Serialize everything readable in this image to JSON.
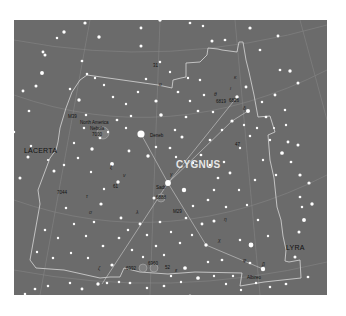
{
  "map": {
    "title": "CYGNUS",
    "background_color": "#6b6b6b",
    "boundary_color": "#d8d8d8",
    "asterism_color": "#cfcfcf",
    "neighbors": [
      {
        "name": "LACERTA",
        "x": 10,
        "y": 127
      },
      {
        "name": "LYRA",
        "x": 272,
        "y": 224
      }
    ],
    "labels": [
      {
        "text": "North America",
        "x": 80,
        "y": 121,
        "kind": "small"
      },
      {
        "text": "Nebula",
        "x": 90,
        "y": 127,
        "kind": "small"
      },
      {
        "text": "7000",
        "x": 92,
        "y": 133,
        "kind": "small"
      },
      {
        "text": "Deneb",
        "x": 150,
        "y": 134,
        "kind": "small"
      },
      {
        "text": "Sadr",
        "x": 156,
        "y": 186,
        "kind": "small"
      },
      {
        "text": "6888",
        "x": 156,
        "y": 196,
        "kind": "small"
      },
      {
        "text": "Albireo",
        "x": 247,
        "y": 276,
        "kind": "small"
      },
      {
        "text": "6826",
        "x": 229,
        "y": 99,
        "kind": "small"
      },
      {
        "text": "6819",
        "x": 216,
        "y": 100,
        "kind": "small"
      },
      {
        "text": "M39",
        "x": 68,
        "y": 115,
        "kind": "small"
      },
      {
        "text": "7044",
        "x": 57,
        "y": 191,
        "kind": "small"
      },
      {
        "text": "6992",
        "x": 126,
        "y": 267,
        "kind": "small"
      },
      {
        "text": "6960",
        "x": 148,
        "y": 262,
        "kind": "small"
      },
      {
        "text": "M29",
        "x": 173,
        "y": 210,
        "kind": "small"
      },
      {
        "text": "61",
        "x": 113,
        "y": 185,
        "kind": "small"
      },
      {
        "text": "52",
        "x": 165,
        "y": 266,
        "kind": "small"
      },
      {
        "text": "47",
        "x": 235,
        "y": 143,
        "kind": "small"
      },
      {
        "text": "31",
        "x": 153,
        "y": 64,
        "kind": "small"
      },
      {
        "text": "o",
        "x": 159,
        "y": 82,
        "kind": "greek"
      },
      {
        "text": "ε",
        "x": 175,
        "y": 268,
        "kind": "greek"
      },
      {
        "text": "ζ",
        "x": 98,
        "y": 266,
        "kind": "greek"
      },
      {
        "text": "ν",
        "x": 123,
        "y": 173,
        "kind": "greek"
      },
      {
        "text": "ξ",
        "x": 110,
        "y": 165,
        "kind": "greek"
      },
      {
        "text": "τ",
        "x": 86,
        "y": 194,
        "kind": "greek"
      },
      {
        "text": "σ",
        "x": 89,
        "y": 210,
        "kind": "greek"
      },
      {
        "text": "η",
        "x": 224,
        "y": 217,
        "kind": "greek"
      },
      {
        "text": "χ",
        "x": 218,
        "y": 238,
        "kind": "greek"
      },
      {
        "text": "δ",
        "x": 243,
        "y": 106,
        "kind": "greek"
      },
      {
        "text": "ι",
        "x": 230,
        "y": 86,
        "kind": "greek"
      },
      {
        "text": "κ",
        "x": 234,
        "y": 75,
        "kind": "greek"
      },
      {
        "text": "θ",
        "x": 214,
        "y": 92,
        "kind": "greek"
      },
      {
        "text": "γ",
        "x": 170,
        "y": 172,
        "kind": "greek"
      },
      {
        "text": "λ",
        "x": 136,
        "y": 210,
        "kind": "greek"
      },
      {
        "text": "β",
        "x": 262,
        "y": 262,
        "kind": "greek"
      },
      {
        "text": "φ",
        "x": 243,
        "y": 258,
        "kind": "greek"
      }
    ],
    "stars": [
      [
        141,
        134,
        4.2
      ],
      [
        168,
        183,
        3.4
      ],
      [
        184,
        190,
        2.6
      ],
      [
        112,
        164,
        2.3
      ],
      [
        148,
        156,
        2.0
      ],
      [
        154,
        198,
        1.8
      ],
      [
        251,
        245,
        2.8
      ],
      [
        263,
        269,
        2.6
      ],
      [
        198,
        278,
        2.2
      ],
      [
        248,
        111,
        2.4
      ],
      [
        237,
        97,
        2.0
      ],
      [
        246,
        87,
        1.7
      ],
      [
        232,
        121,
        1.9
      ],
      [
        185,
        268,
        2.2
      ],
      [
        206,
        245,
        2.0
      ],
      [
        202,
        224,
        1.7
      ],
      [
        214,
        221,
        1.8
      ],
      [
        226,
        207,
        1.5
      ],
      [
        118,
        182,
        2.0
      ],
      [
        121,
        218,
        1.7
      ],
      [
        101,
        204,
        1.9
      ],
      [
        103,
        246,
        1.6
      ],
      [
        98,
        284,
        2.0
      ],
      [
        107,
        283,
        1.5
      ],
      [
        161,
        115,
        2.1
      ],
      [
        156,
        101,
        1.9
      ],
      [
        186,
        117,
        1.6
      ],
      [
        182,
        137,
        1.8
      ],
      [
        156,
        147,
        1.5
      ],
      [
        129,
        151,
        1.7
      ],
      [
        92,
        149,
        2.0
      ],
      [
        100,
        138,
        1.6
      ],
      [
        74,
        143,
        1.4
      ],
      [
        64,
        165,
        1.5
      ],
      [
        54,
        171,
        1.8
      ],
      [
        48,
        160,
        1.3
      ],
      [
        36,
        86,
        1.8
      ],
      [
        70,
        89,
        1.5
      ],
      [
        79,
        100,
        2.0
      ],
      [
        86,
        115,
        1.5
      ],
      [
        42,
        73,
        2.3
      ],
      [
        45,
        55,
        1.8
      ],
      [
        29,
        111,
        1.6
      ],
      [
        23,
        91,
        1.7
      ],
      [
        28,
        157,
        1.8
      ],
      [
        14,
        132,
        1.5
      ],
      [
        20,
        178,
        1.8
      ],
      [
        11,
        209,
        1.6
      ],
      [
        31,
        146,
        1.5
      ],
      [
        64,
        32,
        2.0
      ],
      [
        43,
        52,
        1.7
      ],
      [
        57,
        38,
        1.5
      ],
      [
        85,
        23,
        1.9
      ],
      [
        99,
        37,
        2.0
      ],
      [
        82,
        61,
        1.6
      ],
      [
        141,
        46,
        1.8
      ],
      [
        160,
        20,
        2.0
      ],
      [
        141,
        28,
        1.7
      ],
      [
        190,
        23,
        1.6
      ],
      [
        203,
        26,
        1.5
      ],
      [
        212,
        41,
        1.8
      ],
      [
        225,
        40,
        1.6
      ],
      [
        250,
        28,
        1.9
      ],
      [
        278,
        36,
        1.7
      ],
      [
        260,
        50,
        1.6
      ],
      [
        290,
        71,
        2.0
      ],
      [
        280,
        70,
        1.6
      ],
      [
        275,
        95,
        1.7
      ],
      [
        262,
        102,
        1.5
      ],
      [
        266,
        117,
        1.6
      ],
      [
        298,
        83,
        1.8
      ],
      [
        285,
        110,
        1.5
      ],
      [
        288,
        142,
        1.7
      ],
      [
        298,
        145,
        1.8
      ],
      [
        282,
        153,
        2.2
      ],
      [
        291,
        162,
        1.6
      ],
      [
        300,
        175,
        1.9
      ],
      [
        276,
        175,
        1.5
      ],
      [
        309,
        183,
        1.9
      ],
      [
        300,
        197,
        1.6
      ],
      [
        304,
        220,
        2.3
      ],
      [
        299,
        232,
        1.8
      ],
      [
        302,
        207,
        1.5
      ],
      [
        312,
        204,
        2.0
      ],
      [
        295,
        257,
        1.8
      ],
      [
        308,
        277,
        1.6
      ],
      [
        286,
        284,
        1.6
      ],
      [
        270,
        287,
        1.5
      ],
      [
        250,
        263,
        1.6
      ],
      [
        240,
        240,
        1.5
      ],
      [
        222,
        260,
        1.6
      ],
      [
        233,
        276,
        1.4
      ],
      [
        208,
        262,
        1.5
      ],
      [
        190,
        296,
        1.8
      ],
      [
        164,
        286,
        1.6
      ],
      [
        147,
        288,
        1.5
      ],
      [
        130,
        283,
        1.6
      ],
      [
        119,
        282,
        1.5
      ],
      [
        82,
        289,
        1.7
      ],
      [
        70,
        283,
        1.5
      ],
      [
        48,
        286,
        1.5
      ],
      [
        35,
        289,
        1.6
      ],
      [
        42,
        302,
        2.0
      ],
      [
        25,
        294,
        1.5
      ],
      [
        112,
        265,
        1.9
      ],
      [
        119,
        238,
        1.6
      ],
      [
        128,
        230,
        1.5
      ],
      [
        140,
        224,
        1.7
      ],
      [
        147,
        235,
        1.5
      ],
      [
        160,
        222,
        1.6
      ],
      [
        171,
        232,
        1.4
      ],
      [
        180,
        243,
        1.5
      ],
      [
        192,
        235,
        1.4
      ],
      [
        186,
        218,
        1.6
      ],
      [
        193,
        206,
        1.5
      ],
      [
        208,
        200,
        1.6
      ],
      [
        214,
        190,
        1.5
      ],
      [
        218,
        178,
        1.6
      ],
      [
        230,
        173,
        1.7
      ],
      [
        224,
        162,
        1.5
      ],
      [
        210,
        165,
        1.5
      ],
      [
        201,
        155,
        1.6
      ],
      [
        193,
        163,
        1.5
      ],
      [
        176,
        157,
        1.4
      ],
      [
        170,
        148,
        1.6
      ],
      [
        175,
        130,
        1.5
      ],
      [
        190,
        101,
        1.5
      ],
      [
        198,
        111,
        1.6
      ],
      [
        204,
        95,
        1.5
      ],
      [
        213,
        112,
        1.5
      ],
      [
        222,
        130,
        1.5
      ],
      [
        210,
        140,
        1.6
      ],
      [
        240,
        148,
        1.4
      ],
      [
        250,
        136,
        1.5
      ],
      [
        200,
        80,
        1.5
      ],
      [
        188,
        78,
        1.4
      ],
      [
        178,
        92,
        1.6
      ],
      [
        170,
        72,
        1.4
      ],
      [
        160,
        62,
        1.5
      ],
      [
        146,
        79,
        1.5
      ],
      [
        138,
        92,
        1.5
      ],
      [
        126,
        104,
        1.4
      ],
      [
        113,
        97,
        1.5
      ],
      [
        104,
        85,
        1.4
      ],
      [
        95,
        78,
        1.4
      ],
      [
        87,
        74,
        1.5
      ],
      [
        117,
        120,
        1.6
      ],
      [
        126,
        128,
        1.4
      ],
      [
        131,
        116,
        1.5
      ],
      [
        108,
        132,
        1.4
      ],
      [
        84,
        128,
        1.5
      ],
      [
        78,
        158,
        1.5
      ],
      [
        91,
        172,
        1.4
      ],
      [
        104,
        189,
        1.4
      ],
      [
        94,
        222,
        1.5
      ],
      [
        86,
        236,
        1.4
      ],
      [
        74,
        224,
        1.4
      ],
      [
        66,
        208,
        1.5
      ],
      [
        58,
        238,
        1.4
      ],
      [
        45,
        230,
        1.5
      ],
      [
        37,
        252,
        1.4
      ],
      [
        53,
        258,
        1.5
      ],
      [
        71,
        253,
        1.4
      ],
      [
        88,
        258,
        1.4
      ],
      [
        132,
        250,
        1.5
      ],
      [
        143,
        257,
        1.4
      ],
      [
        156,
        246,
        1.5
      ],
      [
        164,
        255,
        1.4
      ],
      [
        171,
        276,
        1.4
      ],
      [
        181,
        282,
        1.4
      ],
      [
        214,
        276,
        1.4
      ],
      [
        226,
        284,
        1.4
      ],
      [
        241,
        290,
        1.4
      ],
      [
        256,
        283,
        1.4
      ],
      [
        268,
        236,
        1.4
      ],
      [
        258,
        220,
        1.5
      ],
      [
        247,
        205,
        1.4
      ],
      [
        239,
        190,
        1.4
      ],
      [
        255,
        180,
        1.5
      ],
      [
        263,
        160,
        1.4
      ],
      [
        270,
        140,
        1.4
      ],
      [
        257,
        128,
        1.4
      ],
      [
        244,
        125,
        1.4
      ],
      [
        274,
        128,
        1.3
      ],
      [
        286,
        125,
        1.4
      ]
    ],
    "asterism": [
      [
        [
          263,
          269
        ],
        [
          206,
          245
        ],
        [
          168,
          183
        ],
        [
          141,
          134
        ]
      ],
      [
        [
          102,
          284
        ],
        [
          168,
          183
        ],
        [
          232,
          121
        ],
        [
          248,
          111
        ]
      ],
      [
        [
          168,
          183
        ],
        [
          237,
          97
        ]
      ]
    ],
    "nebulae": [
      {
        "x": 103,
        "y": 133,
        "r": 6
      },
      {
        "x": 161,
        "y": 198,
        "r": 4
      },
      {
        "x": 143,
        "y": 268,
        "r": 4
      },
      {
        "x": 154,
        "y": 268,
        "r": 4
      }
    ]
  }
}
